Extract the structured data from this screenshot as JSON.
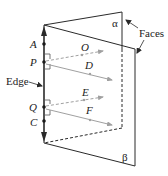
{
  "diagram": {
    "colors": {
      "line": "#2a2a2a",
      "ray": "#9a9a9a",
      "background": "#ffffff"
    },
    "labels": {
      "alpha": "α",
      "beta": "β",
      "faces": "Faces",
      "edge": "Edge",
      "A": "A",
      "P": "P",
      "Q": "Q",
      "C": "C",
      "O": "O",
      "D": "D",
      "E": "E",
      "F": "F"
    },
    "points_on_edge": [
      "A",
      "P",
      "Q",
      "C"
    ],
    "rays": [
      {
        "from": "P",
        "to": "O",
        "style": "dashed",
        "face": "alpha"
      },
      {
        "from": "P",
        "to": "D",
        "style": "solid",
        "face": "beta"
      },
      {
        "from": "Q",
        "to": "E",
        "style": "dashed",
        "face": "alpha"
      },
      {
        "from": "Q",
        "to": "F",
        "style": "solid",
        "face": "beta"
      }
    ]
  }
}
